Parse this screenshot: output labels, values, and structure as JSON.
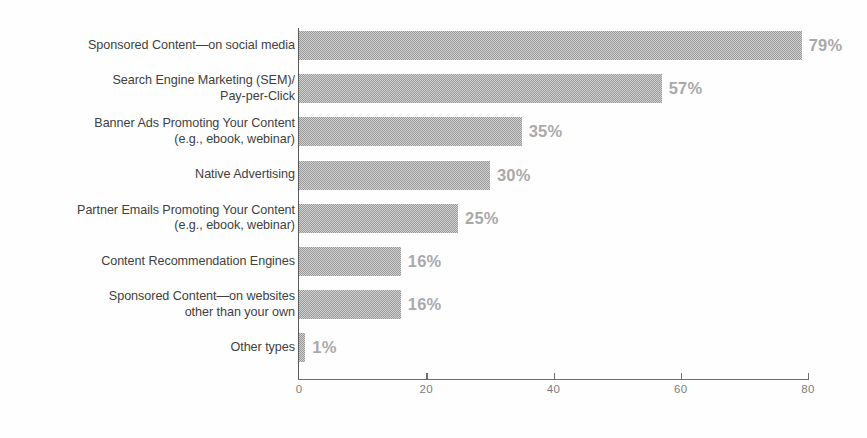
{
  "chart_data": {
    "type": "bar",
    "orientation": "horizontal",
    "title": "",
    "subtitle": "",
    "xlabel": "",
    "ylabel": "",
    "xlim": [
      0,
      80
    ],
    "xticks": [
      0,
      20,
      40,
      60,
      80
    ],
    "xtick_labels": [
      "0",
      "20",
      "40",
      "60",
      "80"
    ],
    "grid": false,
    "legend": null,
    "value_suffix": "%",
    "bar_color": "#9a9a9a",
    "value_label_color": "#a9a9a9",
    "category_label_color": "#3f3f3f",
    "axis_color": "#6d6d6d",
    "categories": [
      "Sponsored Content—on social media",
      "Search Engine Marketing (SEM)/\nPay-per-Click",
      "Banner Ads Promoting Your Content\n(e.g., ebook, webinar)",
      "Native Advertising",
      "Partner Emails Promoting Your Content\n(e.g., ebook, webinar)",
      "Content Recommendation Engines",
      "Sponsored Content—on websites\nother than your own",
      "Other types"
    ],
    "values": [
      79,
      57,
      35,
      30,
      25,
      16,
      16,
      1
    ],
    "value_labels": [
      "79%",
      "57%",
      "35%",
      "30%",
      "25%",
      "16%",
      "16%",
      "1%"
    ]
  },
  "scan_artifacts": {
    "top_fragment": "",
    "bottom_fragment": ""
  }
}
